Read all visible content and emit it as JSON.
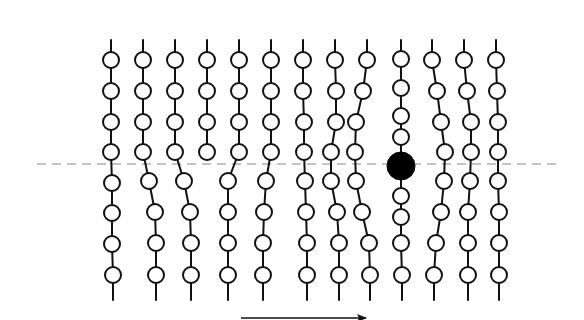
{
  "diagram": {
    "type": "chain-lattice-with-dislocation",
    "colors": {
      "line": "#111111",
      "node_fill": "#ffffff",
      "solid_node": "#000000",
      "dash": "#888888"
    },
    "node_radius": 8,
    "solid_node_radius": 14,
    "dashed_line": {
      "x1": 37,
      "x2": 562,
      "y": 164
    },
    "arrow": {
      "x1": 241,
      "x2": 366,
      "y": 318,
      "direction": "right"
    },
    "chains": [
      {
        "top": [
          111,
          40
        ],
        "nodes": [
          [
            111,
            60
          ],
          [
            111,
            91
          ],
          [
            111,
            122
          ],
          [
            111,
            152
          ],
          [
            112,
            183
          ],
          [
            112,
            213
          ],
          [
            112,
            244
          ],
          [
            113,
            275
          ]
        ],
        "bottom": [
          113,
          300
        ]
      },
      {
        "top": [
          143,
          40
        ],
        "nodes": [
          [
            143,
            60
          ],
          [
            143,
            91
          ],
          [
            143,
            122
          ],
          [
            143,
            152
          ],
          [
            149,
            181
          ],
          [
            155,
            212
          ],
          [
            156,
            243
          ],
          [
            156,
            275
          ]
        ],
        "bottom": [
          156,
          300
        ]
      },
      {
        "top": [
          175,
          40
        ],
        "nodes": [
          [
            175,
            60
          ],
          [
            175,
            91
          ],
          [
            175,
            122
          ],
          [
            175,
            152
          ],
          [
            184,
            181
          ],
          [
            190,
            212
          ],
          [
            191,
            243
          ],
          [
            191,
            275
          ]
        ],
        "bottom": [
          191,
          300
        ]
      },
      {
        "top": [
          207,
          40
        ],
        "nodes": [
          [
            207,
            60
          ],
          [
            207,
            91
          ],
          [
            207,
            122
          ],
          [
            207,
            152
          ]
        ],
        "bottom": null
      },
      {
        "top": null,
        "nodes": [
          [
            228,
            181
          ],
          [
            228,
            212
          ],
          [
            228,
            243
          ],
          [
            228,
            275
          ]
        ],
        "bottom": [
          228,
          300
        ],
        "joins_from": [
          239,
          152
        ]
      },
      {
        "top": [
          239,
          40
        ],
        "nodes": [
          [
            239,
            60
          ],
          [
            239,
            91
          ],
          [
            239,
            122
          ],
          [
            239,
            152
          ]
        ],
        "bottom": null,
        "continues_to": [
          228,
          181
        ]
      },
      {
        "top": [
          271,
          40
        ],
        "nodes": [
          [
            271,
            60
          ],
          [
            271,
            91
          ],
          [
            271,
            122
          ],
          [
            271,
            152
          ],
          [
            266,
            181
          ],
          [
            264,
            212
          ],
          [
            263,
            243
          ],
          [
            263,
            275
          ]
        ],
        "bottom": [
          263,
          300
        ]
      },
      {
        "top": [
          303,
          40
        ],
        "nodes": [
          [
            303,
            60
          ],
          [
            303,
            91
          ],
          [
            304,
            122
          ],
          [
            304,
            152
          ],
          [
            305,
            181
          ],
          [
            306,
            212
          ],
          [
            307,
            243
          ],
          [
            307,
            275
          ]
        ],
        "bottom": [
          307,
          300
        ]
      },
      {
        "top": [
          335,
          40
        ],
        "nodes": [
          [
            335,
            60
          ],
          [
            336,
            91
          ],
          [
            336,
            122
          ],
          [
            331,
            152
          ],
          [
            331,
            181
          ],
          [
            337,
            212
          ],
          [
            339,
            243
          ],
          [
            339,
            275
          ]
        ],
        "bottom": [
          339,
          300
        ]
      },
      {
        "top": [
          367,
          40
        ],
        "nodes": [
          [
            367,
            60
          ],
          [
            363,
            91
          ],
          [
            356,
            122
          ],
          [
            355,
            152
          ],
          [
            356,
            181
          ],
          [
            362,
            212
          ],
          [
            369,
            243
          ],
          [
            370,
            275
          ]
        ],
        "bottom": [
          370,
          300
        ]
      },
      {
        "top": [
          401,
          40
        ],
        "nodes": [
          [
            401,
            59
          ],
          [
            401,
            88
          ],
          [
            401,
            116
          ],
          [
            401,
            137
          ],
          [
            401,
            196
          ],
          [
            401,
            217
          ],
          [
            401,
            243
          ],
          [
            402,
            275
          ]
        ],
        "bottom": [
          402,
          300
        ],
        "solid_node": [
          401,
          166
        ]
      },
      {
        "top": [
          432,
          40
        ],
        "nodes": [
          [
            432,
            60
          ],
          [
            437,
            91
          ],
          [
            441,
            122
          ],
          [
            445,
            152
          ],
          [
            444,
            181
          ],
          [
            441,
            212
          ],
          [
            436,
            243
          ],
          [
            434,
            275
          ]
        ],
        "bottom": [
          434,
          300
        ]
      },
      {
        "top": [
          464,
          40
        ],
        "nodes": [
          [
            464,
            60
          ],
          [
            467,
            91
          ],
          [
            471,
            122
          ],
          [
            471,
            152
          ],
          [
            470,
            181
          ],
          [
            468,
            212
          ],
          [
            468,
            243
          ],
          [
            468,
            275
          ]
        ],
        "bottom": [
          468,
          300
        ]
      },
      {
        "top": [
          496,
          40
        ],
        "nodes": [
          [
            496,
            60
          ],
          [
            497,
            91
          ],
          [
            498,
            122
          ],
          [
            498,
            152
          ],
          [
            498,
            181
          ],
          [
            499,
            212
          ],
          [
            499,
            243
          ],
          [
            499,
            275
          ]
        ],
        "bottom": [
          499,
          300
        ]
      }
    ]
  }
}
